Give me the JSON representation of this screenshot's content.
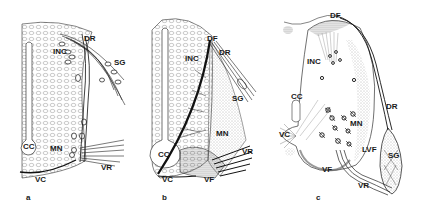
{
  "figure": {
    "colors": {
      "ink": "#1a1a1a",
      "background": "#ffffff",
      "stipple": "#555555"
    },
    "panels": [
      {
        "id": "a",
        "letter": "a",
        "labels": {
          "DR": "DR",
          "INC": "INC",
          "SG": "SG",
          "CC": "CC",
          "MN": "MN",
          "VR": "VR",
          "VC": "VC"
        }
      },
      {
        "id": "b",
        "letter": "b",
        "labels": {
          "DF": "DF",
          "DR": "DR",
          "INC": "INC",
          "SG": "SG",
          "MN": "MN",
          "VR": "VR",
          "CC": "CC",
          "VC": "VC",
          "VF": "VF"
        }
      },
      {
        "id": "c",
        "letter": "c",
        "labels": {
          "DF": "DF",
          "INC": "INC",
          "CC": "CC",
          "DR": "DR",
          "MN": "MN",
          "VC": "VC",
          "LVF": "LVF",
          "SG": "SG",
          "VF": "VF",
          "VR": "VR"
        }
      }
    ]
  }
}
